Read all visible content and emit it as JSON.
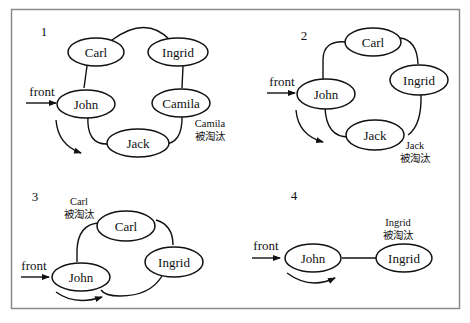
{
  "frame": {
    "border_color": "#8a8a8a"
  },
  "panels": [
    {
      "step": "1",
      "front_label": "front",
      "nodes": [
        "Carl",
        "Ingrid",
        "John",
        "Camila",
        "Jack"
      ],
      "eliminated_name": "Camila",
      "eliminated_text": "被淘汰"
    },
    {
      "step": "2",
      "front_label": "front",
      "nodes": [
        "Carl",
        "Ingrid",
        "John",
        "Jack"
      ],
      "eliminated_name": "Jack",
      "eliminated_text": "被淘汰"
    },
    {
      "step": "3",
      "front_label": "front",
      "nodes": [
        "Carl",
        "Ingrid",
        "John"
      ],
      "eliminated_name": "Carl",
      "eliminated_text": "被淘汰"
    },
    {
      "step": "4",
      "front_label": "front",
      "nodes": [
        "John",
        "Ingrid"
      ],
      "eliminated_name": "Ingrid",
      "eliminated_text": "被淘汰"
    }
  ]
}
